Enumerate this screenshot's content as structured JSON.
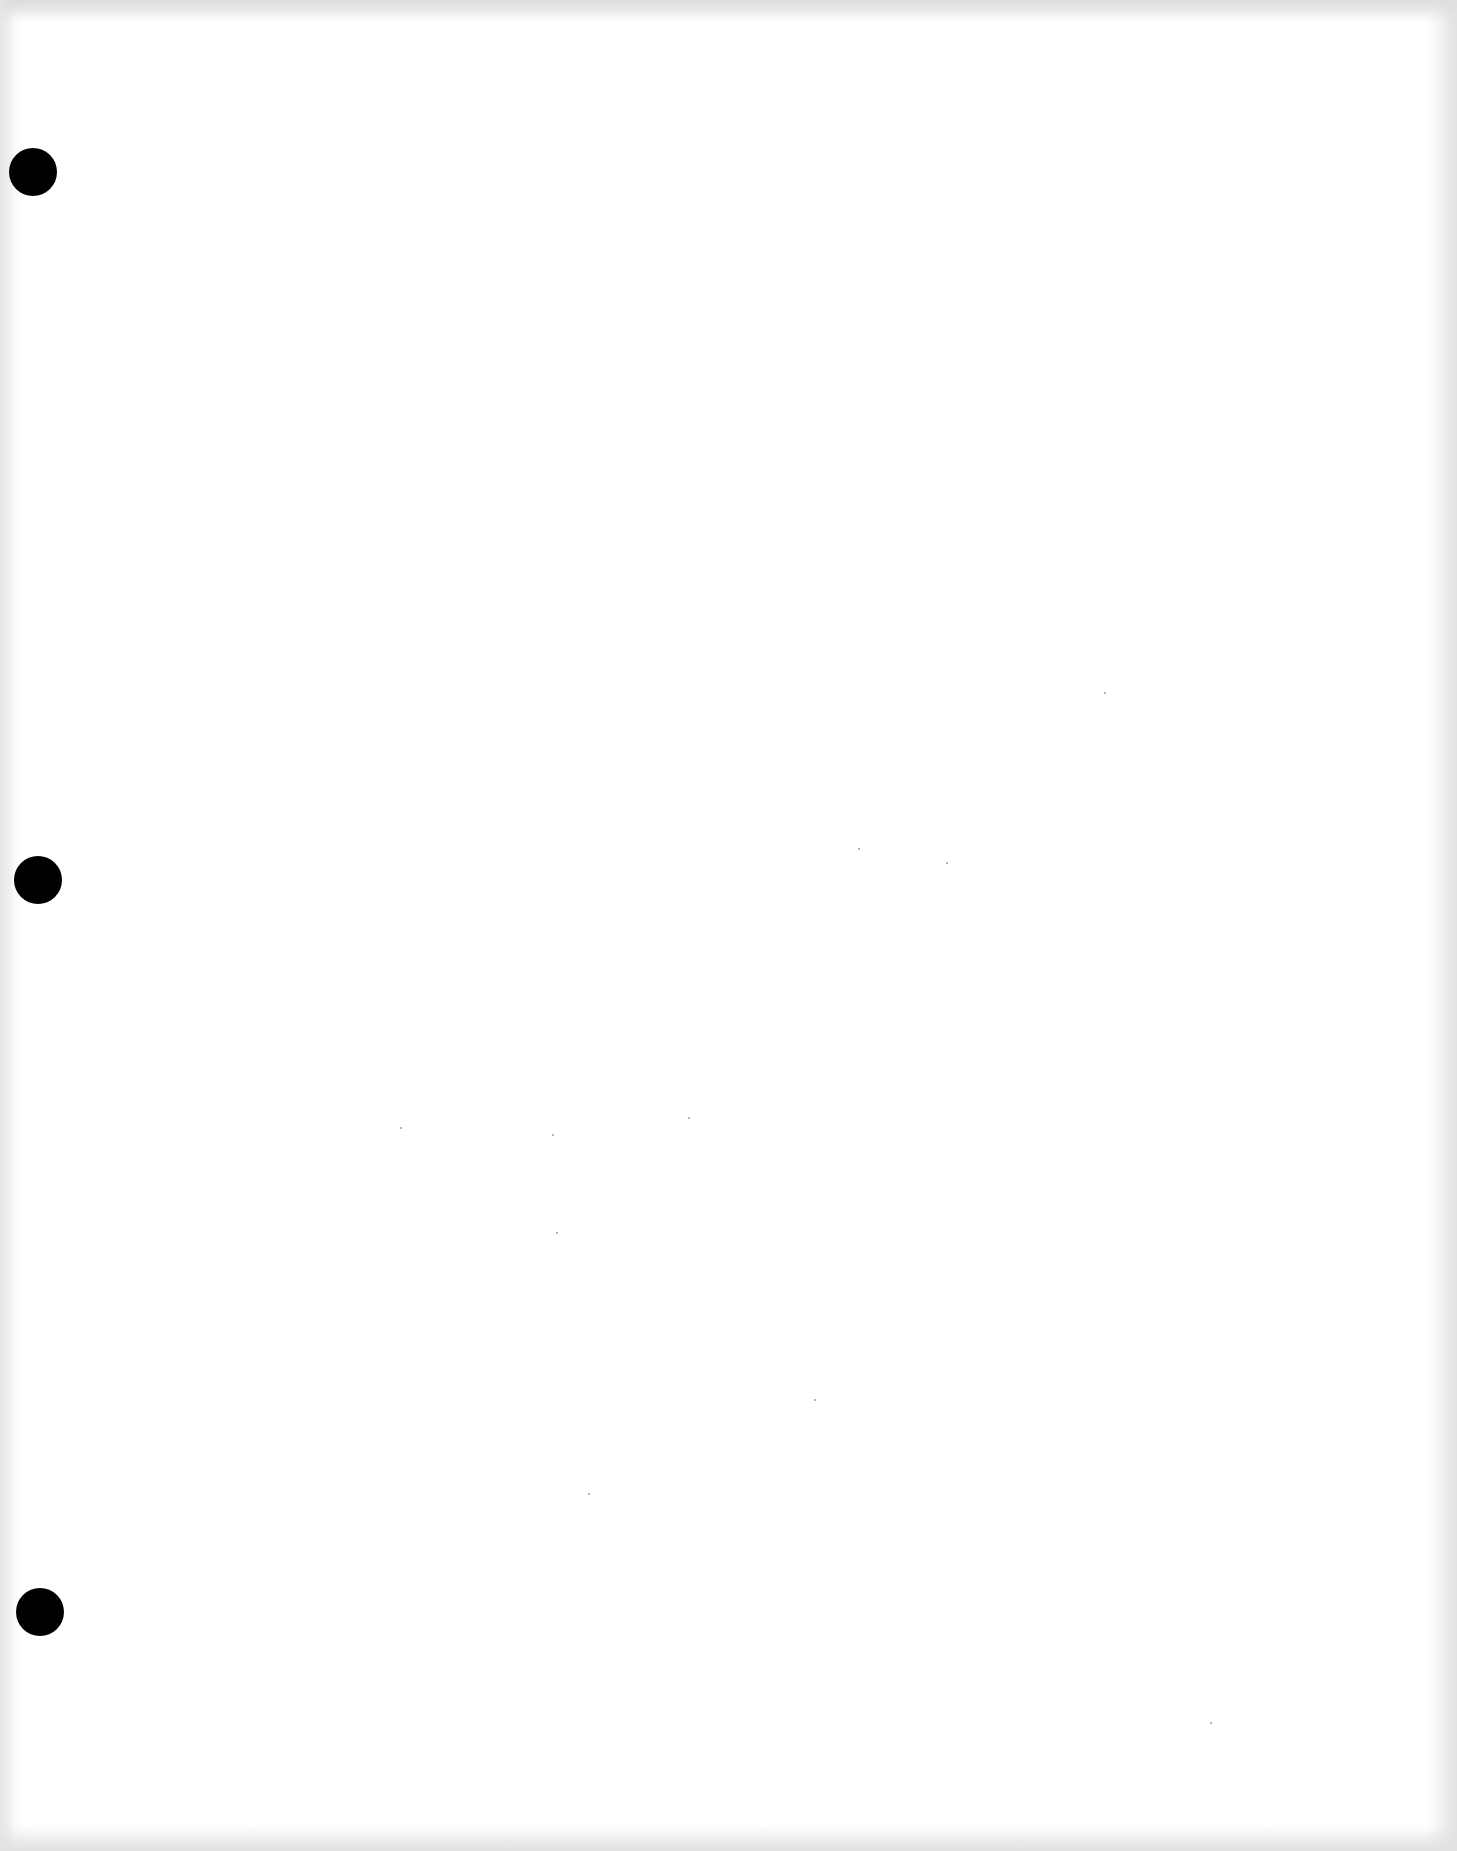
{
  "page": {
    "type": "blank scanned page",
    "background_color": "#ffffff",
    "text_content": ""
  },
  "punch_holes": [
    {
      "name": "top",
      "cx": 33,
      "cy": 172,
      "diameter": 48,
      "color": "#000000"
    },
    {
      "name": "middle",
      "cx": 38,
      "cy": 880,
      "diameter": 48,
      "color": "#000000"
    },
    {
      "name": "bottom",
      "cx": 40,
      "cy": 1612,
      "diameter": 48,
      "color": "#000000"
    }
  ]
}
